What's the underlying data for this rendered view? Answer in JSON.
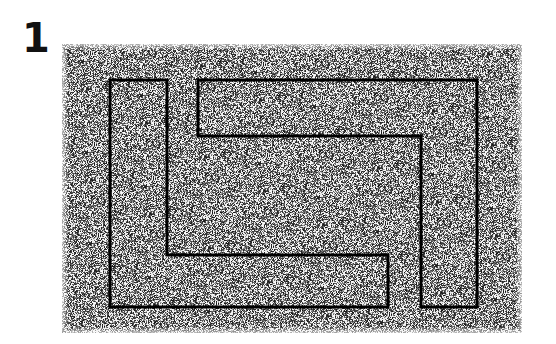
{
  "figure": {
    "label": "1",
    "label_position": {
      "x": 22,
      "y": 16
    },
    "caption": "",
    "background_color": "#ffffff"
  },
  "texture_panel": {
    "name": "noise-rectangle",
    "x": 62,
    "y": 44,
    "width": 460,
    "height": 289,
    "appearance": "random black-and-white speckle / salt-and-pepper noise",
    "mean_gray": "#b4b4b4",
    "speckle_dark": "#2a2a2a",
    "speckle_light": "#ffffff",
    "density": 0.46,
    "edge_softness_px": 6
  },
  "shape": {
    "name": "interlocking-rectilinear-outline",
    "description": "Two interlocking comb-like rectilinear bands forming an S / Z shaped figure-ground pattern",
    "stroke_color": "#000000",
    "stroke_width": 3,
    "fill": "none",
    "paths": [
      {
        "id": "lower-left-band",
        "closed": true,
        "points": [
          [
            110,
            80
          ],
          [
            167,
            80
          ],
          [
            167,
            255
          ],
          [
            388,
            255
          ],
          [
            388,
            307
          ],
          [
            110,
            307
          ]
        ]
      },
      {
        "id": "upper-right-band",
        "closed": true,
        "points": [
          [
            198,
            80
          ],
          [
            477,
            80
          ],
          [
            477,
            307
          ],
          [
            421,
            307
          ],
          [
            421,
            136
          ],
          [
            198,
            136
          ]
        ]
      }
    ],
    "bounds": {
      "x": 110,
      "y": 80,
      "width": 367,
      "height": 227
    }
  },
  "chart_data": {
    "type": "diagram",
    "title": "1",
    "categories": [],
    "values": []
  }
}
